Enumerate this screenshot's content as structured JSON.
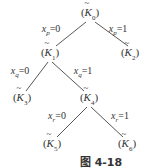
{
  "diagram": {
    "type": "binary-decision-tree",
    "nodes": [
      {
        "id": "K0",
        "symbol": "K",
        "sub": "0",
        "x": 90,
        "y": 14
      },
      {
        "id": "K1",
        "symbol": "K",
        "sub": "1",
        "x": 50,
        "y": 54
      },
      {
        "id": "K2",
        "symbol": "K",
        "sub": "2",
        "x": 130,
        "y": 54
      },
      {
        "id": "K3",
        "symbol": "K",
        "sub": "3",
        "x": 22,
        "y": 99
      },
      {
        "id": "K4",
        "symbol": "K",
        "sub": "4",
        "x": 89,
        "y": 99
      },
      {
        "id": "K5",
        "symbol": "K",
        "sub": "5",
        "x": 52,
        "y": 145
      },
      {
        "id": "K6",
        "symbol": "K",
        "sub": "6",
        "x": 127,
        "y": 145
      }
    ],
    "edges": [
      {
        "from": "K0",
        "to": "K1",
        "var": "x",
        "sub": "p",
        "value": "=0",
        "lx": 51,
        "ly": 30
      },
      {
        "from": "K0",
        "to": "K2",
        "var": "x",
        "sub": "p",
        "value": "=1",
        "lx": 118,
        "ly": 30
      },
      {
        "from": "K1",
        "to": "K3",
        "var": "x",
        "sub": "q",
        "value": "=0",
        "lx": 20,
        "ly": 72
      },
      {
        "from": "K1",
        "to": "K4",
        "var": "x",
        "sub": "q",
        "value": "=1",
        "lx": 83,
        "ly": 72
      },
      {
        "from": "K4",
        "to": "K5",
        "var": "x",
        "sub": "r",
        "value": "=0",
        "lx": 57,
        "ly": 117
      },
      {
        "from": "K4",
        "to": "K6",
        "var": "x",
        "sub": "r",
        "value": "=1",
        "lx": 120,
        "ly": 117
      }
    ],
    "caption": "图 4-18"
  }
}
